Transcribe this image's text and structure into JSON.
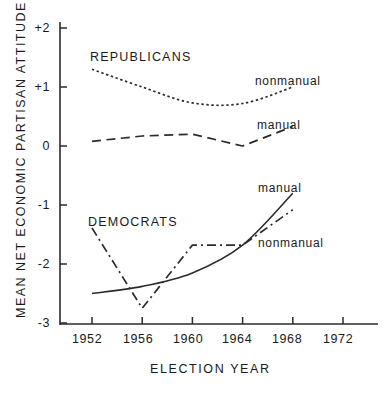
{
  "chart_data": {
    "type": "line",
    "title": "",
    "xlabel": "ELECTION YEAR",
    "ylabel": "MEAN NET ECONOMIC PARTISAN ATTITUDE",
    "x": [
      1952,
      1956,
      1960,
      1964,
      1968,
      1972
    ],
    "xticklabels": [
      "1952",
      "1956",
      "1960",
      "1964",
      "1968",
      "1972"
    ],
    "xlim": [
      1950,
      1974
    ],
    "ylim": [
      -3,
      2
    ],
    "yticks": [
      2,
      1,
      0,
      -1,
      -2,
      -3
    ],
    "yticklabels": [
      "+2",
      "+1",
      "0",
      "-1",
      "-2",
      "-3"
    ],
    "grid": false,
    "legend_position": "inline-annotations",
    "group_annotations": [
      {
        "text": "REPUBLICANS",
        "x": 1953.2,
        "y": 1.62
      },
      {
        "text": "DEMOCRATS",
        "x": 1953.0,
        "y": -1.02
      }
    ],
    "series": [
      {
        "name": "Republicans nonmanual",
        "group": "REPUBLICANS",
        "label": "nonmanual",
        "linestyle": "dotted",
        "x": [
          1952,
          1956,
          1960,
          1964,
          1968
        ],
        "values": [
          1.3,
          1.0,
          0.73,
          0.72,
          1.0
        ],
        "label_x": 1966.4,
        "label_y": 1.28
      },
      {
        "name": "Republicans manual",
        "group": "REPUBLICANS",
        "label": "manual",
        "linestyle": "dashed",
        "x": [
          1952,
          1956,
          1960,
          1964,
          1968
        ],
        "values": [
          0.08,
          0.17,
          0.2,
          0.0,
          0.33
        ],
        "label_x": 1966.4,
        "label_y": 0.62
      },
      {
        "name": "Democrats manual",
        "group": "DEMOCRATS",
        "label": "manual",
        "linestyle": "solid",
        "x": [
          1952,
          1956,
          1960,
          1964,
          1968
        ],
        "values": [
          -2.5,
          -2.38,
          -2.15,
          -1.68,
          -0.8
        ],
        "label_x": 1966.4,
        "label_y": -0.42
      },
      {
        "name": "Democrats nonmanual",
        "group": "DEMOCRATS",
        "label": "nonmanual",
        "linestyle": "dashdot",
        "x": [
          1952,
          1956,
          1960,
          1964,
          1968
        ],
        "values": [
          -1.39,
          -2.75,
          -1.68,
          -1.68,
          -1.08
        ],
        "label_x": 1966.4,
        "label_y": -1.28
      }
    ]
  },
  "axes": {
    "y_title": "MEAN NET ECONOMIC PARTISAN ATTITUDE",
    "x_title": "ELECTION YEAR",
    "y_labels": [
      "+2",
      "+1",
      "0",
      "-1",
      "-2",
      "-3"
    ],
    "x_labels": [
      "1952",
      "1956",
      "1960",
      "1964",
      "1968",
      "1972"
    ]
  },
  "annotations": {
    "republicans": "REPUBLICANS",
    "democrats": "DEMOCRATS",
    "rep_nonmanual": "nonmanual",
    "rep_manual": "manual",
    "dem_manual": "manual",
    "dem_nonmanual": "nonmanual"
  },
  "colors": {
    "ink": "#1a1a1a",
    "background": "#ffffff"
  }
}
